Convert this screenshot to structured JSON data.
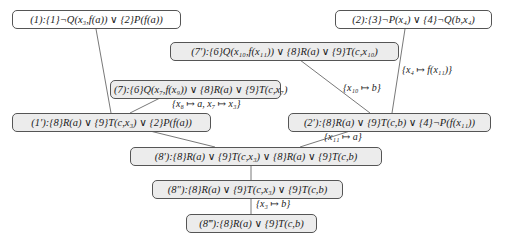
{
  "diagram": {
    "type": "resolution-derivation-tree",
    "nodes": [
      {
        "id": "n1",
        "label": "(1):{1}¬Q(x₃,f(a)) ∨ {2}P(f(a))",
        "kind": "input"
      },
      {
        "id": "n2",
        "label": "(2):{3}¬P(x₄) ∨ {4}¬Q(b,x₄)",
        "kind": "input"
      },
      {
        "id": "n7p",
        "label": "(7′):{6}Q(x₁₀,f(x₁₁)) ∨ {8}R(a) ∨ {9}T(c,x₁₀)",
        "kind": "derived"
      },
      {
        "id": "n7",
        "label": "(7):{6}Q(x₇,f(x₉)) ∨ {8}R(a) ∨ {9}T(c,x₇)",
        "kind": "derived"
      },
      {
        "id": "n1p",
        "label": "(1′):{8}R(a) ∨ {9}T(c,x₃) ∨ {2}P(f(a))",
        "kind": "derived"
      },
      {
        "id": "n2p",
        "label": "(2′):{8}R(a) ∨ {9}T(c,b) ∨ {4}¬P(f(x₁₁))",
        "kind": "derived"
      },
      {
        "id": "n8p",
        "label": "(8′):{8}R(a) ∨ {9}T(c,x₃) ∨ {8}R(a) ∨ {9}T(c,b)",
        "kind": "derived"
      },
      {
        "id": "n8pp",
        "label": "(8″):{8}R(a) ∨ {9}T(c,x₃) ∨ {9}T(c,b)",
        "kind": "derived"
      },
      {
        "id": "n8ppp",
        "label": "(8‴):{8}R(a) ∨ {9}T(c,b)",
        "kind": "derived"
      }
    ],
    "edges": [
      {
        "from": "n1",
        "to": "n1p",
        "label": ""
      },
      {
        "from": "n7",
        "to": "n1p",
        "label": "{x₈ ↦ a, x₇ ↦ x₃}"
      },
      {
        "from": "n2",
        "to": "n2p",
        "label": "{x₄ ↦ f(x₁₁)}"
      },
      {
        "from": "n7p",
        "to": "n2p",
        "label": "{x₁₀ ↦ b}"
      },
      {
        "from": "n1p",
        "to": "n8p",
        "label": ""
      },
      {
        "from": "n2p",
        "to": "n8p",
        "label": "{x₁₁ ↦ a}"
      },
      {
        "from": "n8p",
        "to": "n8pp",
        "label": ""
      },
      {
        "from": "n8pp",
        "to": "n8ppp",
        "label": "{x₃ ↦ b}"
      }
    ],
    "colors": {
      "input_fill": "#ffffff",
      "derived_fill": "#ececec",
      "border": "#555555",
      "edge": "#555555"
    }
  }
}
